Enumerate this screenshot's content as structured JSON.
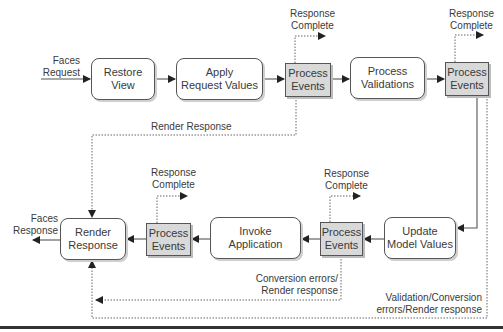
{
  "diagram": {
    "phases": {
      "restore_view": "Restore\nView",
      "apply_request_values": "Apply\nRequest Values",
      "process_validations": "Process\nValidations",
      "update_model_values": "Update\nModel Values",
      "invoke_application": "Invoke\nApplication",
      "render_response": "Render\nResponse"
    },
    "process_events": "Process\nEvents",
    "labels": {
      "faces_request": "Faces\nRequest",
      "faces_response": "Faces\nResponse",
      "response_complete": "Response\nComplete",
      "render_response_path": "Render Response",
      "conversion_errors": "Conversion errors/\nRender response",
      "validation_conversion_errors": "Validation/Conversion\nerrors/Render response"
    },
    "colors": {
      "events_fill": "#d9d9d9",
      "stroke": "#555555",
      "text": "#3a3a3a"
    }
  }
}
